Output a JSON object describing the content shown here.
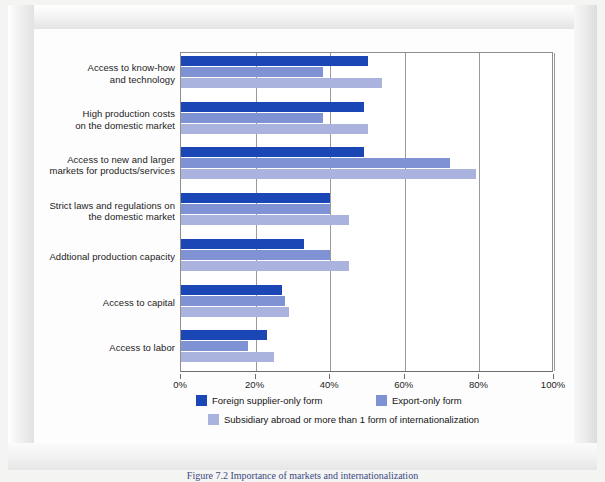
{
  "figure": {
    "caption": "Figure 7.2  Importance of markets and internationalization"
  },
  "chart_data": {
    "type": "bar",
    "orientation": "horizontal",
    "title": "",
    "xlabel": "",
    "ylabel": "",
    "xlim": [
      0,
      100
    ],
    "xticks": [
      "0%",
      "20%",
      "40%",
      "60%",
      "80%",
      "100%"
    ],
    "xtick_values": [
      0,
      20,
      40,
      60,
      80,
      100
    ],
    "grid": true,
    "legend_position": "bottom",
    "categories": [
      "Access to know-how and technology",
      "High production costs on the domestic market",
      "Access to new and larger markets for products/services",
      "Strict laws and regulations on the domestic market",
      "Addtional production capacity",
      "Access to capital",
      "Access to labor"
    ],
    "category_lines": [
      [
        "Access to know-how",
        "and technology"
      ],
      [
        "High production costs",
        "on the domestic market"
      ],
      [
        "Access to new and larger",
        "markets for products/services"
      ],
      [
        "Strict laws and regulations on",
        "the domestic market"
      ],
      [
        "Addtional production capacity"
      ],
      [
        "Access to capital"
      ],
      [
        "Access to labor"
      ]
    ],
    "series": [
      {
        "name": "Foreign supplier-only form",
        "color": "#1a47b5",
        "values": [
          50,
          49,
          49,
          40,
          33,
          27,
          23
        ]
      },
      {
        "name": "Export-only form",
        "color": "#7f93d4",
        "values": [
          38,
          38,
          72,
          40,
          40,
          28,
          18
        ]
      },
      {
        "name": "Subsidiary abroad or more than 1 form of internationalization",
        "color": "#aab3de",
        "values": [
          54,
          50,
          79,
          45,
          45,
          29,
          25
        ]
      }
    ]
  }
}
